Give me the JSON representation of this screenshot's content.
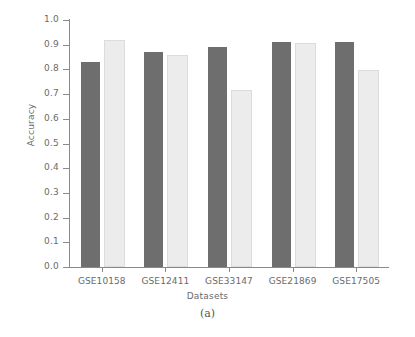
{
  "chart_data": {
    "type": "bar",
    "title": "",
    "xlabel": "Datasets",
    "ylabel": "Accuracy",
    "categories": [
      "GSE10158",
      "GSE12411",
      "GSE33147",
      "GSE21869",
      "GSE17505"
    ],
    "series": [
      {
        "name": "series-1",
        "color": "#6e6e6e",
        "values": [
          0.83,
          0.87,
          0.89,
          0.91,
          0.91
        ]
      },
      {
        "name": "series-2",
        "color": "#ececec",
        "values": [
          0.91,
          0.85,
          0.71,
          0.9,
          0.79
        ]
      }
    ],
    "ylim": [
      0.0,
      1.0
    ],
    "ytick_labels": [
      "1.0",
      "0.9",
      "0.8",
      "0.7",
      "0.6",
      "0.5",
      "0.4",
      "0.3",
      "0.2",
      "0.1",
      "0.0"
    ],
    "ytick_values": [
      1.0,
      0.9,
      0.8,
      0.7,
      0.6,
      0.5,
      0.4,
      0.3,
      0.2,
      0.1,
      0.0
    ],
    "grid": false,
    "legend": "none"
  },
  "caption": "(a)",
  "colors": {
    "axis": "#8a8a8a",
    "tick_text": "#6a6a6a",
    "bar_dark": "#6e6e6e",
    "bar_light": "#ececec",
    "bar_light_edge": "#dcdcdc",
    "background": "#ffffff"
  }
}
